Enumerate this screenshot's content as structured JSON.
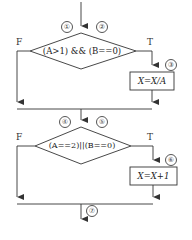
{
  "diagram": {
    "type": "flowchart",
    "decisions": [
      {
        "id": "d1",
        "condition": "(A>1) && (B==0)",
        "false_label": "F",
        "true_label": "T",
        "markers": [
          "①",
          "②"
        ]
      },
      {
        "id": "d2",
        "condition": "(A==2)||(B==0)",
        "false_label": "F",
        "true_label": "T",
        "markers": [
          "④",
          "⑤"
        ]
      }
    ],
    "processes": [
      {
        "id": "p1",
        "statement": "X=X/A",
        "marker": "③"
      },
      {
        "id": "p2",
        "statement": "X=X+1",
        "marker": "⑥"
      }
    ],
    "exit_marker": "⑦",
    "line_color": "#333333"
  }
}
